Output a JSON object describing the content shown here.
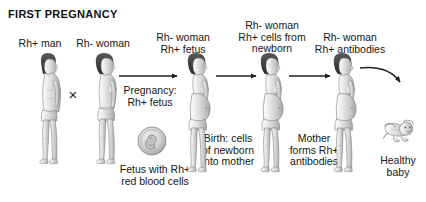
{
  "figure": {
    "title": "FIRST PREGNANCY",
    "background_color": "#ffffff",
    "ink_color": "#1a1a1a",
    "style": "grayscale pen-and-ink medical textbook illustration"
  },
  "labels": {
    "father": "Rh+ man",
    "mother": "Rh- woman",
    "cross_symbol": "×",
    "pregnancy_arrow_caption": "Pregnancy:\nRh+ fetus",
    "pregnant_mother": "Rh- woman\nRh+ fetus",
    "fetus_caption": "Fetus with Rh+\nred blood cells",
    "birth_caption": "Birth: cells\nof newborn\ninto mother",
    "mother_with_cells": "Rh- woman\nRh+ cells from\nnewborn",
    "antibody_caption": "Mother\nforms Rh+\nantibodies",
    "mother_with_antibodies": "Rh- woman\nRh+ antibodies",
    "baby": "Healthy\nbaby"
  },
  "icons": {
    "father_figure": "male-figure-icon",
    "mother_figure": "female-figure-icon",
    "pregnant_figure": "pregnant-female-figure-icon",
    "fetus_circle": "fetus-circle-icon",
    "baby_figure": "baby-figure-icon",
    "arrow": "arrow-right-icon",
    "curved_arrow": "curved-arrow-icon",
    "cross": "cross-mating-icon"
  }
}
